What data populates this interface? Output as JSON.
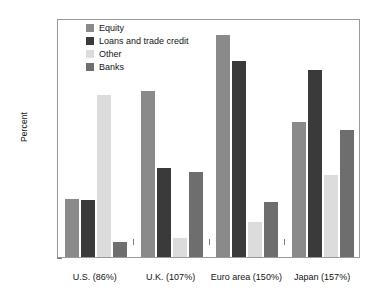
{
  "chart_data": {
    "type": "bar",
    "title": "",
    "subtitle": "",
    "xlabel": "",
    "ylabel": "Percent",
    "ylim": [
      0,
      70
    ],
    "yticks": [
      0,
      10,
      20,
      30,
      40,
      50,
      60,
      70
    ],
    "ytick_labels": [
      "0",
      "10",
      "20",
      "30",
      "40",
      "50",
      "60",
      "70"
    ],
    "grid": false,
    "legend_position": "inside-top-left",
    "categories": [
      "U.S. (86%)",
      "U.K. (107%)",
      "Euro area (150%)",
      "Japan (157%)"
    ],
    "series": [
      {
        "name": "Equity",
        "color": "#8a8a8a",
        "values": [
          17.0,
          48.5,
          65.0,
          39.5
        ]
      },
      {
        "name": "Loans and trade credit",
        "color": "#3a3a3a",
        "values": [
          16.8,
          26.0,
          57.5,
          54.8
        ]
      },
      {
        "name": "Other",
        "color": "#dcdcdc",
        "values": [
          47.5,
          5.5,
          10.2,
          24.0
        ]
      },
      {
        "name": "Banks",
        "color": "#6e6e6e",
        "values": [
          4.5,
          25.0,
          16.0,
          37.3
        ]
      }
    ]
  },
  "legend": {
    "items": [
      {
        "label": "Equity",
        "color": "#8a8a8a"
      },
      {
        "label": "Loans and trade credit",
        "color": "#3a3a3a"
      },
      {
        "label": "Other",
        "color": "#dcdcdc"
      },
      {
        "label": "Banks",
        "color": "#6e6e6e"
      }
    ]
  },
  "axes": {
    "y_title": "Percent"
  }
}
